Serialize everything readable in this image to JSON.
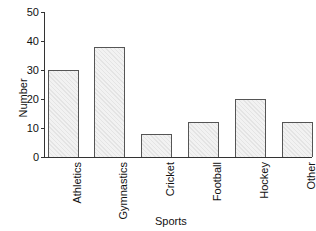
{
  "chart_data": {
    "type": "bar",
    "title": "",
    "xlabel": "Sports",
    "ylabel": "Number",
    "categories": [
      "Athletics",
      "Gymnastics",
      "Cricket",
      "Football",
      "Hockey",
      "Other"
    ],
    "values": [
      30,
      38,
      8,
      12,
      20,
      12
    ],
    "ylim": [
      0,
      50
    ],
    "yticks": [
      "0",
      "10",
      "20",
      "30",
      "40",
      "50"
    ],
    "grid": false,
    "legend": null,
    "bar_fill": "#f2f2f2",
    "bar_edge": "#555555"
  }
}
